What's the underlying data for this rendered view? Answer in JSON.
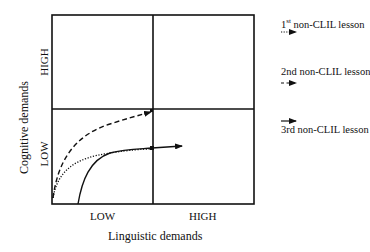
{
  "diagram": {
    "x_axis": {
      "title": "Linguistic demands",
      "low_label": "LOW",
      "high_label": "HIGH"
    },
    "y_axis": {
      "title": "Cognitive demands",
      "low_label": "LOW",
      "high_label": "HIGH"
    },
    "legend": [
      {
        "ordinal": "1",
        "ordinal_suffix": "st",
        "label": " non-CLIL lesson",
        "style": "dotted"
      },
      {
        "label": "2nd non-CLIL lesson",
        "style": "dashed"
      },
      {
        "label": "3rd non-CLIL lesson",
        "style": "solid"
      }
    ],
    "colors": {
      "line": "#111111",
      "background": "#ffffff"
    }
  }
}
